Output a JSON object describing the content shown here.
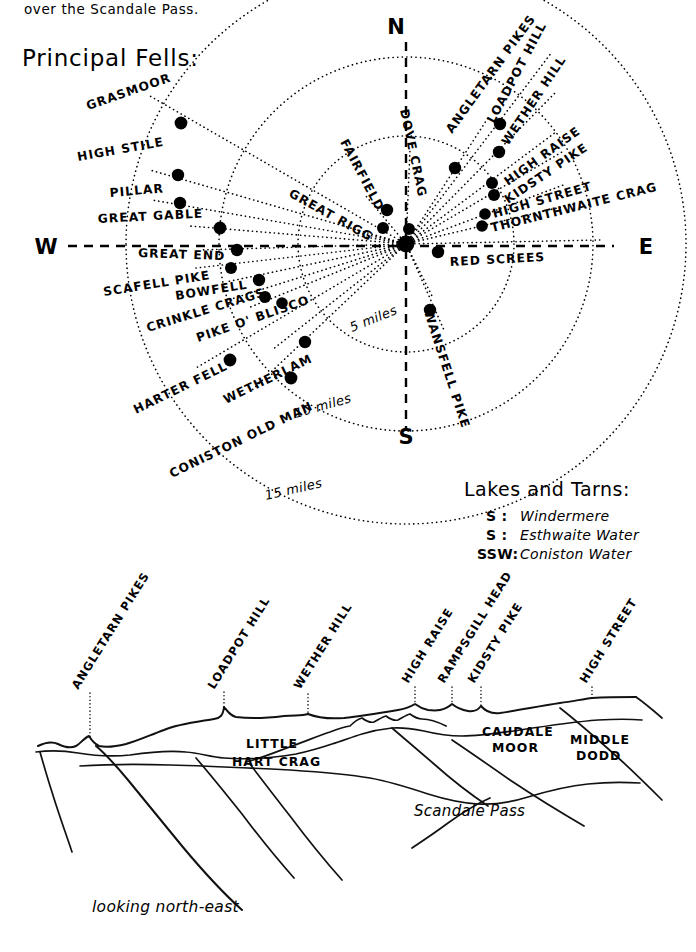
{
  "page": {
    "intro_text": "over the Scandale Pass.",
    "section_title": "Principal Fells:",
    "looking_caption": "looking north-east"
  },
  "compass": {
    "north": "N",
    "south": "S",
    "east": "E",
    "west": "W"
  },
  "distance_rings": [
    {
      "label": "5 miles",
      "miles": 5
    },
    {
      "label": "10 miles",
      "miles": 10
    },
    {
      "label": "15 miles",
      "miles": 15
    }
  ],
  "fells": [
    {
      "name": "GRASMOOR",
      "side": "left",
      "dot": [
        181,
        123
      ]
    },
    {
      "name": "HIGH STILE",
      "side": "left",
      "dot": [
        178,
        175
      ]
    },
    {
      "name": "PILLAR",
      "side": "left",
      "dot": [
        180,
        203
      ]
    },
    {
      "name": "GREAT GABLE",
      "side": "left",
      "dot": [
        220,
        228
      ]
    },
    {
      "name": "GREAT END",
      "side": "left",
      "dot": [
        237,
        250
      ]
    },
    {
      "name": "SCAFELL PIKE",
      "side": "left",
      "dot": [
        231,
        268
      ]
    },
    {
      "name": "BOWFELL",
      "side": "left",
      "dot": [
        259,
        280
      ]
    },
    {
      "name": "CRINKLE CRAGS",
      "side": "left",
      "dot": [
        265,
        297
      ]
    },
    {
      "name": "PIKE O' BLISCO",
      "side": "left",
      "dot": [
        282,
        303
      ]
    },
    {
      "name": "HARTER FELL",
      "side": "left",
      "dot": [
        230,
        360
      ]
    },
    {
      "name": "WETHERLAM",
      "side": "left",
      "dot": [
        305,
        342
      ]
    },
    {
      "name": "CONISTON OLD MAN",
      "side": "left",
      "dot": [
        291,
        378
      ]
    },
    {
      "name": "GREAT RIGG",
      "side": "top",
      "dot": [
        383,
        228
      ]
    },
    {
      "name": "FAIRFIELD",
      "side": "top",
      "dot": [
        387,
        210
      ]
    },
    {
      "name": "DOVE CRAG",
      "side": "top",
      "dot": [
        409,
        229
      ]
    },
    {
      "name": "ANGLETARN PIKES",
      "side": "right",
      "dot": [
        455,
        168
      ]
    },
    {
      "name": "LOADPOT HILL",
      "side": "right",
      "dot": [
        500,
        124
      ]
    },
    {
      "name": "WETHER HILL",
      "side": "right",
      "dot": [
        499,
        152
      ]
    },
    {
      "name": "HIGH RAISE",
      "side": "right",
      "dot": [
        492,
        183
      ]
    },
    {
      "name": "KIDSTY PIKE",
      "side": "right",
      "dot": [
        494,
        195
      ]
    },
    {
      "name": "HIGH STREET",
      "side": "right",
      "dot": [
        485,
        214
      ]
    },
    {
      "name": "THORNTHWAITE CRAG",
      "side": "right",
      "dot": [
        482,
        226
      ]
    },
    {
      "name": "RED SCREES",
      "side": "right",
      "dot": [
        438,
        252
      ]
    },
    {
      "name": "WANSFELL PIKE",
      "side": "right",
      "dot": [
        430,
        310
      ]
    }
  ],
  "lakes": {
    "heading": "Lakes and Tarns:",
    "items": [
      {
        "bearing": "S :",
        "name": "Windermere"
      },
      {
        "bearing": "S :",
        "name": "Esthwaite Water"
      },
      {
        "bearing": "SSW:",
        "name": "Coniston Water"
      }
    ]
  },
  "panorama": {
    "summit_labels": [
      "ANGLETARN PIKES",
      "LOADPOT HILL",
      "WETHER HILL",
      "HIGH RAISE",
      "RAMPSGILL HEAD",
      "KIDSTY PIKE",
      "HIGH STREET"
    ],
    "inline_labels": [
      {
        "line1": "LITTLE",
        "line2": "HART CRAG"
      },
      {
        "line1": "CAUDALE",
        "line2": "MOOR"
      },
      {
        "line1": "MIDDLE",
        "line2": "DODD"
      }
    ],
    "pass_label": "Scandale Pass"
  }
}
